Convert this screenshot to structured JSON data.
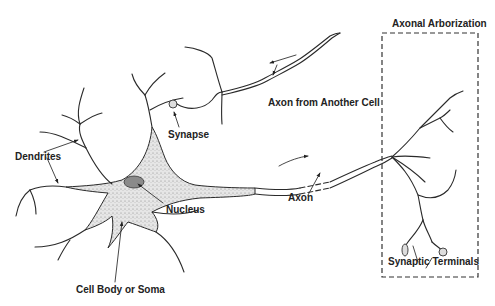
{
  "diagram": {
    "labels": {
      "axonal_arborization": "Axonal Arborization",
      "axon_from_another_cell": "Axon from Another Cell",
      "synapse": "Synapse",
      "dendrites": "Dendrites",
      "nucleus": "Nucleus",
      "axon": "Axon",
      "cell_body": "Cell Body or Soma",
      "synaptic_terminals": "Synaptic Terminals"
    },
    "colors": {
      "line": "#2a2a2a",
      "soma_fill": "#d9d9d9",
      "nucleus_fill": "#8a8a8a",
      "background": "#ffffff"
    }
  }
}
